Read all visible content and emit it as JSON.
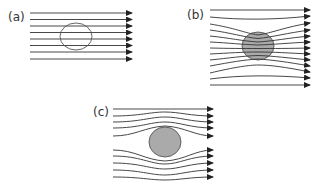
{
  "panels": [
    {
      "id": "a",
      "label": "(a)",
      "description": "uniform field lines, object outline (no distortion)"
    },
    {
      "id": "b",
      "label": "(b)",
      "description": "field lines converge into shaded object"
    },
    {
      "id": "c",
      "label": "(c)",
      "description": "field lines diverge around shaded object"
    }
  ],
  "colors": {
    "line": "#333333",
    "object_fill": "#aaaaaa",
    "object_stroke": "#555555"
  }
}
